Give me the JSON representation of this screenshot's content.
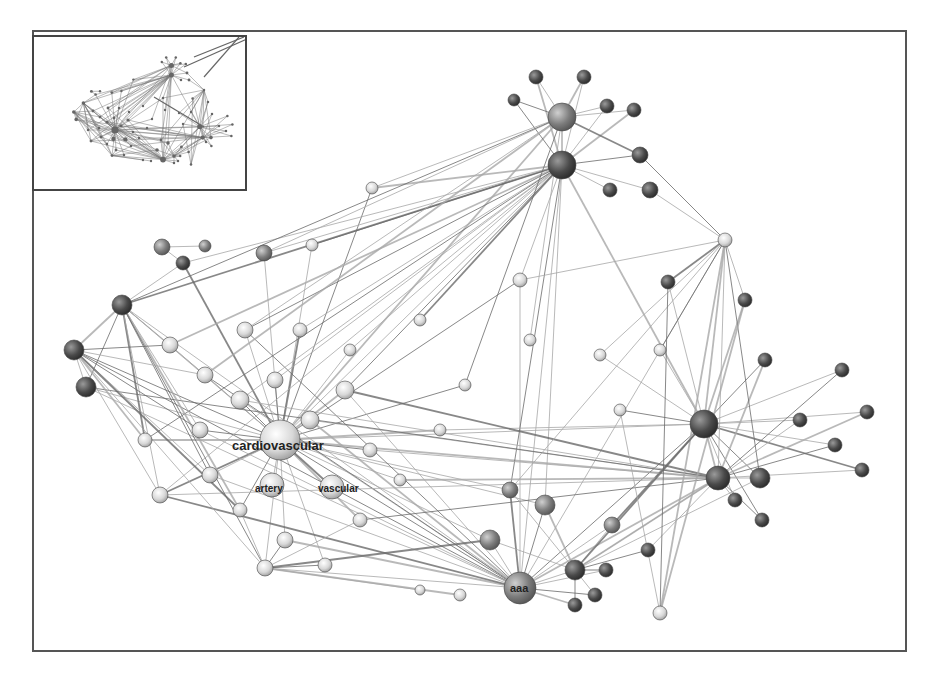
{
  "figure": {
    "type": "network-graph",
    "frame": {
      "x": 32,
      "y": 30,
      "w": 875,
      "h": 622
    },
    "inset": {
      "x": 32,
      "y": 35,
      "w": 215,
      "h": 156,
      "description": "overview thumbnail of full graph"
    },
    "colors": {
      "edge": "#6a6a6a",
      "edge_light": "#a8a8a8",
      "node_dark": "#4a4a4a",
      "node_mid": "#7d7d7d",
      "node_light": "#d8d8d8",
      "border": "#555555",
      "label": "#222222"
    },
    "labels": [
      {
        "text": "cardiovascular",
        "x": 232,
        "y": 450,
        "size": 13
      },
      {
        "text": "artery",
        "x": 255,
        "y": 492,
        "size": 10
      },
      {
        "text": "vascular",
        "x": 318,
        "y": 492,
        "size": 10
      },
      {
        "text": "aaa",
        "x": 510,
        "y": 592,
        "size": 11
      }
    ],
    "nodes": [
      {
        "id": "cardiovascular",
        "x": 280,
        "y": 440,
        "r": 20,
        "tone": "light"
      },
      {
        "id": "aaa",
        "x": 520,
        "y": 588,
        "r": 16,
        "tone": "mid"
      },
      {
        "id": "artery",
        "x": 272,
        "y": 485,
        "r": 12,
        "tone": "light"
      },
      {
        "id": "vascular",
        "x": 332,
        "y": 487,
        "r": 12,
        "tone": "light"
      },
      {
        "id": "n_top_hub",
        "x": 562,
        "y": 117,
        "r": 14,
        "tone": "mid"
      },
      {
        "id": "n_top2",
        "x": 562,
        "y": 165,
        "r": 14,
        "tone": "dark"
      },
      {
        "id": "n_top3",
        "x": 536,
        "y": 77,
        "r": 7,
        "tone": "dark"
      },
      {
        "id": "n_top4",
        "x": 584,
        "y": 77,
        "r": 7,
        "tone": "dark"
      },
      {
        "id": "n_top5",
        "x": 514,
        "y": 100,
        "r": 6,
        "tone": "dark"
      },
      {
        "id": "n_top6",
        "x": 607,
        "y": 106,
        "r": 7,
        "tone": "dark"
      },
      {
        "id": "n_top7",
        "x": 634,
        "y": 110,
        "r": 7,
        "tone": "dark"
      },
      {
        "id": "n_top8",
        "x": 640,
        "y": 155,
        "r": 8,
        "tone": "dark"
      },
      {
        "id": "n_top9",
        "x": 650,
        "y": 190,
        "r": 8,
        "tone": "dark"
      },
      {
        "id": "n_top10",
        "x": 610,
        "y": 190,
        "r": 7,
        "tone": "dark"
      },
      {
        "id": "n_right_hub",
        "x": 704,
        "y": 424,
        "r": 14,
        "tone": "dark"
      },
      {
        "id": "n_right2",
        "x": 718,
        "y": 478,
        "r": 12,
        "tone": "dark"
      },
      {
        "id": "n_right3",
        "x": 760,
        "y": 478,
        "r": 10,
        "tone": "dark"
      },
      {
        "id": "n_right4",
        "x": 842,
        "y": 370,
        "r": 7,
        "tone": "dark"
      },
      {
        "id": "n_right5",
        "x": 867,
        "y": 412,
        "r": 7,
        "tone": "dark"
      },
      {
        "id": "n_right6",
        "x": 862,
        "y": 470,
        "r": 7,
        "tone": "dark"
      },
      {
        "id": "n_right7",
        "x": 835,
        "y": 445,
        "r": 7,
        "tone": "dark"
      },
      {
        "id": "n_right8",
        "x": 800,
        "y": 420,
        "r": 7,
        "tone": "dark"
      },
      {
        "id": "n_right9",
        "x": 765,
        "y": 360,
        "r": 7,
        "tone": "dark"
      },
      {
        "id": "n_right10",
        "x": 745,
        "y": 300,
        "r": 7,
        "tone": "dark"
      },
      {
        "id": "n_right11",
        "x": 668,
        "y": 282,
        "r": 7,
        "tone": "dark"
      },
      {
        "id": "n_right12",
        "x": 762,
        "y": 520,
        "r": 7,
        "tone": "dark"
      },
      {
        "id": "n_right13",
        "x": 735,
        "y": 500,
        "r": 7,
        "tone": "dark"
      },
      {
        "id": "n_star",
        "x": 725,
        "y": 240,
        "r": 7,
        "tone": "light"
      },
      {
        "id": "n_left1",
        "x": 74,
        "y": 350,
        "r": 10,
        "tone": "dark"
      },
      {
        "id": "n_left2",
        "x": 86,
        "y": 387,
        "r": 10,
        "tone": "dark"
      },
      {
        "id": "n_left3",
        "x": 122,
        "y": 305,
        "r": 10,
        "tone": "dark"
      },
      {
        "id": "n_left4",
        "x": 183,
        "y": 263,
        "r": 7,
        "tone": "dark"
      },
      {
        "id": "n_left5",
        "x": 162,
        "y": 247,
        "r": 8,
        "tone": "mid"
      },
      {
        "id": "n_left6",
        "x": 205,
        "y": 246,
        "r": 6,
        "tone": "mid"
      },
      {
        "id": "n_left7",
        "x": 264,
        "y": 253,
        "r": 8,
        "tone": "mid"
      },
      {
        "id": "n_left8",
        "x": 312,
        "y": 245,
        "r": 6,
        "tone": "light"
      },
      {
        "id": "n_mid1",
        "x": 372,
        "y": 188,
        "r": 6,
        "tone": "light"
      },
      {
        "id": "n_mid2",
        "x": 520,
        "y": 280,
        "r": 7,
        "tone": "light"
      },
      {
        "id": "n_mid3",
        "x": 490,
        "y": 540,
        "r": 10,
        "tone": "mid"
      },
      {
        "id": "n_mid4",
        "x": 575,
        "y": 570,
        "r": 10,
        "tone": "dark"
      },
      {
        "id": "n_mid5",
        "x": 545,
        "y": 505,
        "r": 10,
        "tone": "mid"
      },
      {
        "id": "n_mid6",
        "x": 612,
        "y": 525,
        "r": 8,
        "tone": "mid"
      },
      {
        "id": "n_mid7",
        "x": 575,
        "y": 605,
        "r": 7,
        "tone": "dark"
      },
      {
        "id": "n_mid8",
        "x": 595,
        "y": 595,
        "r": 7,
        "tone": "dark"
      },
      {
        "id": "n_mid9",
        "x": 606,
        "y": 570,
        "r": 7,
        "tone": "dark"
      },
      {
        "id": "n_mid10",
        "x": 648,
        "y": 550,
        "r": 7,
        "tone": "dark"
      },
      {
        "id": "n_bottom_right",
        "x": 660,
        "y": 613,
        "r": 7,
        "tone": "light"
      },
      {
        "id": "n_lb1",
        "x": 160,
        "y": 495,
        "r": 8,
        "tone": "light"
      },
      {
        "id": "n_lb2",
        "x": 265,
        "y": 568,
        "r": 8,
        "tone": "light"
      },
      {
        "id": "n_lb3",
        "x": 325,
        "y": 565,
        "r": 7,
        "tone": "light"
      },
      {
        "id": "n_lb4",
        "x": 420,
        "y": 590,
        "r": 5,
        "tone": "light"
      },
      {
        "id": "n_lb5",
        "x": 460,
        "y": 595,
        "r": 6,
        "tone": "light"
      },
      {
        "id": "n_c1",
        "x": 240,
        "y": 400,
        "r": 9,
        "tone": "light"
      },
      {
        "id": "n_c2",
        "x": 345,
        "y": 390,
        "r": 9,
        "tone": "light"
      },
      {
        "id": "n_c3",
        "x": 205,
        "y": 375,
        "r": 8,
        "tone": "light"
      },
      {
        "id": "n_c4",
        "x": 275,
        "y": 380,
        "r": 8,
        "tone": "light"
      },
      {
        "id": "n_c5",
        "x": 310,
        "y": 420,
        "r": 9,
        "tone": "light"
      },
      {
        "id": "n_c6",
        "x": 145,
        "y": 440,
        "r": 7,
        "tone": "light"
      },
      {
        "id": "n_c7",
        "x": 200,
        "y": 430,
        "r": 8,
        "tone": "light"
      },
      {
        "id": "n_c8",
        "x": 170,
        "y": 345,
        "r": 8,
        "tone": "light"
      },
      {
        "id": "n_c9",
        "x": 245,
        "y": 330,
        "r": 8,
        "tone": "light"
      },
      {
        "id": "n_c10",
        "x": 300,
        "y": 330,
        "r": 7,
        "tone": "light"
      },
      {
        "id": "n_c11",
        "x": 350,
        "y": 350,
        "r": 6,
        "tone": "light"
      },
      {
        "id": "n_c12",
        "x": 210,
        "y": 475,
        "r": 8,
        "tone": "light"
      },
      {
        "id": "n_c13",
        "x": 370,
        "y": 450,
        "r": 7,
        "tone": "light"
      },
      {
        "id": "n_c14",
        "x": 360,
        "y": 520,
        "r": 7,
        "tone": "light"
      },
      {
        "id": "n_c15",
        "x": 285,
        "y": 540,
        "r": 8,
        "tone": "light"
      },
      {
        "id": "n_c16",
        "x": 240,
        "y": 510,
        "r": 7,
        "tone": "light"
      },
      {
        "id": "n_c17",
        "x": 400,
        "y": 480,
        "r": 6,
        "tone": "light"
      },
      {
        "id": "n_c18",
        "x": 440,
        "y": 430,
        "r": 6,
        "tone": "light"
      },
      {
        "id": "n_c19",
        "x": 465,
        "y": 385,
        "r": 6,
        "tone": "light"
      },
      {
        "id": "n_c20",
        "x": 510,
        "y": 490,
        "r": 8,
        "tone": "mid"
      },
      {
        "id": "n_c21",
        "x": 620,
        "y": 410,
        "r": 6,
        "tone": "light"
      },
      {
        "id": "n_c22",
        "x": 600,
        "y": 355,
        "r": 6,
        "tone": "light"
      },
      {
        "id": "n_c23",
        "x": 660,
        "y": 350,
        "r": 6,
        "tone": "light"
      },
      {
        "id": "n_c24",
        "x": 420,
        "y": 320,
        "r": 6,
        "tone": "light"
      },
      {
        "id": "n_c25",
        "x": 530,
        "y": 340,
        "r": 6,
        "tone": "light"
      }
    ],
    "edges_from_hubs": [
      {
        "hub": "cardiovascular",
        "targets": [
          "n_left1",
          "n_left2",
          "n_left3",
          "n_left4",
          "n_left7",
          "n_left8",
          "n_mid1",
          "n_top_hub",
          "n_top2",
          "n_mid2",
          "n_right_hub",
          "n_right2",
          "aaa",
          "n_mid3",
          "n_mid5",
          "n_lb1",
          "n_lb2",
          "n_lb3",
          "n_c1",
          "n_c2",
          "n_c3",
          "n_c4",
          "n_c5",
          "n_c6",
          "n_c7",
          "n_c8",
          "n_c9",
          "n_c10",
          "n_c11",
          "n_c12",
          "n_c13",
          "n_c14",
          "n_c15",
          "n_c16",
          "n_c17",
          "n_c18",
          "n_c19",
          "n_c20",
          "artery",
          "vascular"
        ]
      },
      {
        "hub": "aaa",
        "targets": [
          "n_c1",
          "n_c2",
          "n_c3",
          "n_c5",
          "n_c7",
          "n_c9",
          "n_c12",
          "n_c15",
          "n_left1",
          "n_left2",
          "n_left3",
          "n_lb1",
          "n_lb2",
          "n_top2",
          "n_right_hub",
          "n_right2",
          "n_mid4",
          "n_mid5",
          "n_mid6",
          "n_mid7",
          "n_mid8",
          "n_mid9",
          "n_mid3",
          "n_c20",
          "n_mid2",
          "n_star"
        ]
      },
      {
        "hub": "n_top2",
        "targets": [
          "n_top_hub",
          "n_top3",
          "n_top4",
          "n_top5",
          "n_top6",
          "n_top7",
          "n_top8",
          "n_top9",
          "n_top10",
          "n_left3",
          "n_left4",
          "n_left7",
          "n_left8",
          "n_mid1",
          "n_c1",
          "n_c2",
          "n_c4",
          "n_c8",
          "n_c9",
          "n_c10",
          "n_c11",
          "n_c24",
          "n_mid2",
          "n_mid5",
          "n_c20",
          "n_right_hub",
          "n_lb1",
          "n_c6"
        ]
      },
      {
        "hub": "n_top_hub",
        "targets": [
          "n_top3",
          "n_top4",
          "n_top5",
          "n_top6",
          "n_top7",
          "n_top8",
          "n_mid1",
          "n_left7",
          "n_left3",
          "n_c3",
          "n_c9",
          "n_c19",
          "n_c25"
        ]
      },
      {
        "hub": "n_right_hub",
        "targets": [
          "n_right2",
          "n_right3",
          "n_right4",
          "n_right5",
          "n_right6",
          "n_right7",
          "n_right8",
          "n_right9",
          "n_right10",
          "n_right11",
          "n_right12",
          "n_right13",
          "n_star",
          "n_c21",
          "n_c22",
          "n_c23",
          "n_mid6",
          "n_c18"
        ]
      },
      {
        "hub": "n_right2",
        "targets": [
          "n_right3",
          "n_right4",
          "n_right5",
          "n_right6",
          "n_right7",
          "n_right8",
          "n_right9",
          "n_right12",
          "n_right13",
          "n_c1",
          "n_c2",
          "n_c5",
          "n_c13",
          "n_c14",
          "n_c17",
          "n_lb1",
          "n_left2",
          "n_mid10",
          "n_mid4"
        ]
      },
      {
        "hub": "n_star",
        "targets": [
          "n_top8",
          "n_top9",
          "n_right10",
          "n_right11",
          "n_mid2",
          "n_c22",
          "n_c23",
          "n_bottom_right",
          "n_right2",
          "n_right3",
          "n_c20"
        ]
      },
      {
        "hub": "n_left3",
        "targets": [
          "n_left1",
          "n_left2",
          "n_left4",
          "n_c3",
          "n_c6",
          "n_c7",
          "n_c8",
          "n_c12",
          "n_c16",
          "n_lb1",
          "n_lb2"
        ]
      },
      {
        "hub": "n_left1",
        "targets": [
          "n_left2",
          "n_c6",
          "n_c7",
          "n_c12",
          "n_lb1",
          "n_c16",
          "n_lb2",
          "n_c3",
          "n_c8"
        ]
      },
      {
        "hub": "n_mid4",
        "targets": [
          "n_mid5",
          "n_mid6",
          "n_mid7",
          "n_mid8",
          "n_mid9",
          "n_mid10",
          "n_c20",
          "n_mid3",
          "n_right_hub",
          "n_right2",
          "n_right3"
        ]
      },
      {
        "hub": "n_bottom_right",
        "targets": [
          "n_right11",
          "n_right10",
          "n_c21"
        ]
      },
      {
        "hub": "n_lb2",
        "targets": [
          "n_lb3",
          "n_lb4",
          "n_lb5",
          "n_c15",
          "n_c16",
          "n_c14",
          "n_mid3"
        ]
      },
      {
        "hub": "n_left5",
        "targets": [
          "n_left6",
          "n_left4"
        ]
      }
    ]
  }
}
